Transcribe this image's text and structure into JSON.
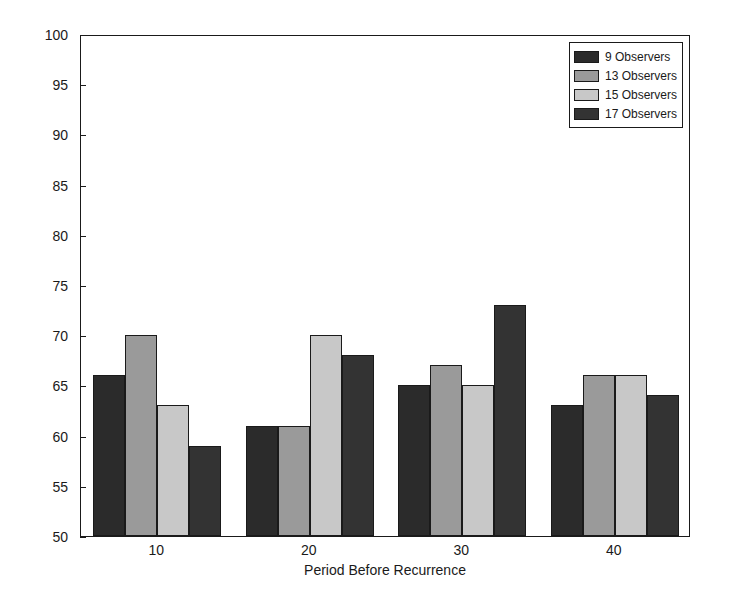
{
  "chart_data": {
    "type": "bar",
    "title": "",
    "xlabel": "Period Before Recurrence",
    "ylabel": "% Success",
    "categories": [
      "10",
      "20",
      "30",
      "40"
    ],
    "ylim": [
      50,
      100
    ],
    "yticks": [
      50,
      55,
      60,
      65,
      70,
      75,
      80,
      85,
      90,
      95,
      100
    ],
    "grid": false,
    "legend_position": "top-right",
    "series": [
      {
        "name": "9 Observers",
        "color": "#2b2b2b",
        "values": [
          66,
          61,
          65,
          63
        ]
      },
      {
        "name": "13 Observers",
        "color": "#9a9a9a",
        "values": [
          70,
          61,
          67,
          66
        ]
      },
      {
        "name": "15 Observers",
        "color": "#c8c8c8",
        "values": [
          63,
          70,
          65,
          66
        ]
      },
      {
        "name": "17 Observers",
        "color": "#333333",
        "values": [
          59,
          68,
          73,
          64
        ]
      }
    ]
  },
  "axes": {
    "y_label": "% Success",
    "x_label": "Period Before Recurrence",
    "y_tick_labels": [
      "100",
      "95",
      "90",
      "85",
      "80",
      "75",
      "70",
      "65",
      "60",
      "55",
      "50"
    ],
    "x_tick_labels": [
      "10",
      "20",
      "30",
      "40"
    ]
  },
  "legend": {
    "entries": [
      {
        "label": "9 Observers"
      },
      {
        "label": "13 Observers"
      },
      {
        "label": "15 Observers"
      },
      {
        "label": "17 Observers"
      }
    ]
  }
}
